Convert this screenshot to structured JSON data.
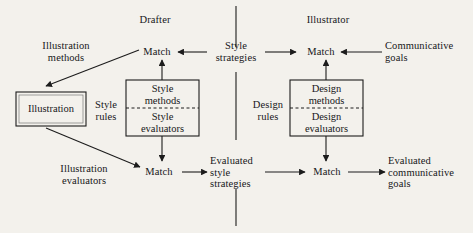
{
  "diagram": {
    "background_color": "#f3f1ec",
    "line_color": "#1c1c1c",
    "columns": {
      "left_header": "Drafter",
      "right_header": "Illustrator"
    },
    "nodes": {
      "illustration_methods": "Illustration\nmethods",
      "match_top_left": "Match",
      "style_strategies": "Style\nstrategies",
      "match_top_right": "Match",
      "communicative_goals": "Communicative\ngoals",
      "illustration_box": "Illustration",
      "style_rules": "Style\nrules",
      "style_methods": "Style\nmethods",
      "style_evaluators": "Style\nevaluators",
      "design_rules": "Design\nrules",
      "design_methods": "Design\nmethods",
      "design_evaluators": "Design\nevaluators",
      "illustration_evaluators": "Illustration\nevaluators",
      "match_bottom_left": "Match",
      "evaluated_style_strategies": "Evaluated\nstyle\nstrategies",
      "match_bottom_right": "Match",
      "evaluated_communicative_goals": "Evaluated\ncommunicative\ngoals"
    },
    "edges": [
      {
        "from": "style_strategies",
        "to": "match_top_left",
        "direction": "left"
      },
      {
        "from": "communicative_goals",
        "to": "match_top_right",
        "direction": "left"
      },
      {
        "from": "style_strategies",
        "to": "match_top_right",
        "direction": "right"
      },
      {
        "from": "style_methods",
        "to": "match_top_left",
        "direction": "up"
      },
      {
        "from": "design_methods",
        "to": "match_top_right",
        "direction": "up"
      },
      {
        "from": "match_top_left",
        "to": "illustration_box",
        "direction": "diagonal-down-left"
      },
      {
        "from": "illustration_box",
        "to": "match_bottom_left",
        "direction": "diagonal-down-right"
      },
      {
        "from": "style_evaluators",
        "to": "match_bottom_left",
        "direction": "down"
      },
      {
        "from": "design_evaluators",
        "to": "match_bottom_right",
        "direction": "down"
      },
      {
        "from": "match_bottom_left",
        "to": "evaluated_style_strategies",
        "direction": "right"
      },
      {
        "from": "evaluated_style_strategies",
        "to": "match_bottom_right",
        "direction": "right"
      },
      {
        "from": "match_bottom_right",
        "to": "evaluated_communicative_goals",
        "direction": "right"
      }
    ]
  }
}
